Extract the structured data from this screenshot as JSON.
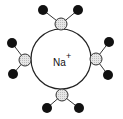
{
  "diagram": {
    "ion": {
      "label": "Na",
      "charge": "+",
      "center": [
        61,
        59
      ],
      "radius": 30,
      "fill": "#ffffff",
      "stroke": "#222222"
    },
    "colors": {
      "oxygen_fill": "#d8d8d8",
      "hydrogen_fill": "#111111",
      "bond": "#333333"
    },
    "water_molecules": [
      {
        "position": "top",
        "oxygen": [
          61,
          24
        ],
        "hydrogens": [
          [
            43,
            10
          ],
          [
            78,
            10
          ]
        ]
      },
      {
        "position": "left",
        "oxygen": [
          25,
          60
        ],
        "hydrogens": [
          [
            12,
            43
          ],
          [
            13,
            74
          ]
        ]
      },
      {
        "position": "right",
        "oxygen": [
          96,
          59
        ],
        "hydrogens": [
          [
            109,
            42
          ],
          [
            108,
            75
          ]
        ]
      },
      {
        "position": "bottom",
        "oxygen": [
          62,
          95
        ],
        "hydrogens": [
          [
            47,
            108
          ],
          [
            79,
            108
          ]
        ]
      }
    ]
  }
}
